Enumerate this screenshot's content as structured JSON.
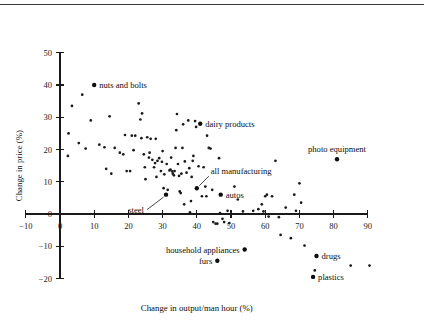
{
  "chart_data": {
    "type": "scatter",
    "title": "",
    "xlabel": "Change in output/man hour (%)",
    "ylabel": "Change in price (%)",
    "xlim": [
      -12,
      95
    ],
    "ylim": [
      -21,
      51
    ],
    "xticks": [
      -10,
      0,
      10,
      20,
      30,
      40,
      50,
      60,
      70,
      80,
      90
    ],
    "yticks": [
      -20,
      -10,
      0,
      10,
      20,
      30,
      40,
      50
    ],
    "xtick_labels": [
      "-10",
      "0",
      "10",
      "20",
      "30",
      "40",
      "50",
      "60",
      "70",
      "80",
      "90"
    ],
    "ytick_labels": [
      "-20",
      "-10",
      "0",
      "10",
      "20",
      "30",
      "40",
      "50"
    ],
    "grid": false,
    "legend": "none",
    "marker": "filled-circle",
    "marker_color": "#1a1a1a",
    "labeled_points": [
      {
        "name": "nuts and bolts",
        "x": 10,
        "y": 40,
        "label_side": "right"
      },
      {
        "name": "dairy products",
        "x": 41,
        "y": 28,
        "label_side": "right"
      },
      {
        "name": "photo equipment",
        "x": 81,
        "y": 17,
        "label_side": "above"
      },
      {
        "name": "all manufacturing",
        "x": 40,
        "y": 8,
        "label_side": "leader-upper-right"
      },
      {
        "name": "steel",
        "x": 31,
        "y": 6,
        "label_side": "leader-lower-left"
      },
      {
        "name": "autos",
        "x": 47,
        "y": 6,
        "label_side": "right"
      },
      {
        "name": "household appliances",
        "x": 54,
        "y": -11,
        "label_side": "left"
      },
      {
        "name": "furs",
        "x": 46,
        "y": -14.5,
        "label_side": "left"
      },
      {
        "name": "drugs",
        "x": 75,
        "y": -13,
        "label_side": "right"
      },
      {
        "name": "plastics",
        "x": 74,
        "y": -19.5,
        "label_side": "right"
      }
    ],
    "points": [
      {
        "x": 2.5,
        "y": 25
      },
      {
        "x": 2.3,
        "y": 18
      },
      {
        "x": 3.5,
        "y": 33.5
      },
      {
        "x": 5.5,
        "y": 22
      },
      {
        "x": 6.5,
        "y": 37
      },
      {
        "x": 7.5,
        "y": 20.3
      },
      {
        "x": 9,
        "y": 29
      },
      {
        "x": 10,
        "y": 40
      },
      {
        "x": 11.5,
        "y": 21.5
      },
      {
        "x": 13,
        "y": 20.7
      },
      {
        "x": 13.5,
        "y": 14
      },
      {
        "x": 14.5,
        "y": 30.3
      },
      {
        "x": 15,
        "y": 12.5
      },
      {
        "x": 16,
        "y": 20.5
      },
      {
        "x": 17.5,
        "y": 19
      },
      {
        "x": 18.5,
        "y": 18.5
      },
      {
        "x": 19,
        "y": 24.5
      },
      {
        "x": 19.5,
        "y": 13.3
      },
      {
        "x": 20.5,
        "y": 13.3
      },
      {
        "x": 21,
        "y": 24.3
      },
      {
        "x": 22,
        "y": 24.3
      },
      {
        "x": 21.5,
        "y": 19.8
      },
      {
        "x": 23,
        "y": 34.3
      },
      {
        "x": 23.5,
        "y": 29.3
      },
      {
        "x": 23.8,
        "y": 23.5
      },
      {
        "x": 24,
        "y": 31.2
      },
      {
        "x": 24.5,
        "y": 18.5
      },
      {
        "x": 24.8,
        "y": 14.5
      },
      {
        "x": 25,
        "y": 10.8
      },
      {
        "x": 25.5,
        "y": 23.8
      },
      {
        "x": 26,
        "y": 17.5
      },
      {
        "x": 26.5,
        "y": 23.3
      },
      {
        "x": 26.2,
        "y": 19
      },
      {
        "x": 27,
        "y": 16.8
      },
      {
        "x": 27.5,
        "y": 14.5
      },
      {
        "x": 27.8,
        "y": 15.8
      },
      {
        "x": 28,
        "y": 23.3
      },
      {
        "x": 28.5,
        "y": 16.5
      },
      {
        "x": 28.2,
        "y": 11.5
      },
      {
        "x": 29,
        "y": 17.3
      },
      {
        "x": 29.5,
        "y": 13.3
      },
      {
        "x": 29.8,
        "y": 16.2
      },
      {
        "x": 30,
        "y": 19.5
      },
      {
        "x": 30.5,
        "y": 12.3
      },
      {
        "x": 30.3,
        "y": 8
      },
      {
        "x": 31,
        "y": 6
      },
      {
        "x": 31.5,
        "y": 7.5
      },
      {
        "x": 31.2,
        "y": 15.5
      },
      {
        "x": 32,
        "y": 13.5
      },
      {
        "x": 32.3,
        "y": 13.8
      },
      {
        "x": 32.5,
        "y": 17.5
      },
      {
        "x": 32.8,
        "y": 13.2
      },
      {
        "x": 33,
        "y": 12.5
      },
      {
        "x": 33.3,
        "y": 12
      },
      {
        "x": 33.5,
        "y": 13.3
      },
      {
        "x": 33.8,
        "y": 20.5
      },
      {
        "x": 34,
        "y": 26
      },
      {
        "x": 34.2,
        "y": 31
      },
      {
        "x": 34.5,
        "y": 15.5
      },
      {
        "x": 34.8,
        "y": 11.8
      },
      {
        "x": 35,
        "y": 7
      },
      {
        "x": 35.3,
        "y": 6.5
      },
      {
        "x": 35.5,
        "y": 12.5
      },
      {
        "x": 35.8,
        "y": 20.5
      },
      {
        "x": 36,
        "y": 27.8
      },
      {
        "x": 36.3,
        "y": 3
      },
      {
        "x": 36.5,
        "y": 16.3
      },
      {
        "x": 37,
        "y": 12.8
      },
      {
        "x": 37.5,
        "y": 29
      },
      {
        "x": 37.8,
        "y": 14.2
      },
      {
        "x": 38,
        "y": 0.5
      },
      {
        "x": 38.3,
        "y": 4
      },
      {
        "x": 38.5,
        "y": 11.5
      },
      {
        "x": 38.8,
        "y": 16.5
      },
      {
        "x": 39,
        "y": 18
      },
      {
        "x": 39.5,
        "y": 28.8
      },
      {
        "x": 39.8,
        "y": 27
      },
      {
        "x": 40,
        "y": 8
      },
      {
        "x": 40.5,
        "y": 14.8
      },
      {
        "x": 41,
        "y": 28
      },
      {
        "x": 41.5,
        "y": 5.5
      },
      {
        "x": 42,
        "y": 14.5
      },
      {
        "x": 42.5,
        "y": 8.5
      },
      {
        "x": 42.8,
        "y": 5.5
      },
      {
        "x": 43,
        "y": 24.3
      },
      {
        "x": 43.5,
        "y": 20.5
      },
      {
        "x": 44,
        "y": 20.3
      },
      {
        "x": 44.5,
        "y": 7.5
      },
      {
        "x": 44.8,
        "y": -2.5
      },
      {
        "x": 45.5,
        "y": -3
      },
      {
        "x": 46,
        "y": -3
      },
      {
        "x": 46.5,
        "y": 17.3
      },
      {
        "x": 46.8,
        "y": 0.3
      },
      {
        "x": 47,
        "y": 6
      },
      {
        "x": 47.5,
        "y": -1.5
      },
      {
        "x": 48,
        "y": -2.5
      },
      {
        "x": 49,
        "y": 1
      },
      {
        "x": 49.5,
        "y": -2.8
      },
      {
        "x": 51,
        "y": 8.5
      },
      {
        "x": 52,
        "y": 4.5
      },
      {
        "x": 53.5,
        "y": 0.8
      },
      {
        "x": 54,
        "y": -11
      },
      {
        "x": 56.5,
        "y": 1
      },
      {
        "x": 58,
        "y": 1.5
      },
      {
        "x": 59,
        "y": 3
      },
      {
        "x": 59.5,
        "y": 0.8
      },
      {
        "x": 60,
        "y": 5.5
      },
      {
        "x": 60.5,
        "y": 6
      },
      {
        "x": 61,
        "y": -0.8
      },
      {
        "x": 62,
        "y": 5.5
      },
      {
        "x": 63,
        "y": 16.5
      },
      {
        "x": 64,
        "y": -1
      },
      {
        "x": 64.5,
        "y": -6.5
      },
      {
        "x": 66,
        "y": 2
      },
      {
        "x": 67.5,
        "y": -7.5
      },
      {
        "x": 68.5,
        "y": 6
      },
      {
        "x": 69,
        "y": 1
      },
      {
        "x": 70,
        "y": 9.5
      },
      {
        "x": 70.5,
        "y": 3.5
      },
      {
        "x": 71.5,
        "y": -9.8
      },
      {
        "x": 74,
        "y": -19.5
      },
      {
        "x": 74.5,
        "y": -17.5
      },
      {
        "x": 75,
        "y": -13
      },
      {
        "x": 81,
        "y": 17
      },
      {
        "x": 85,
        "y": -16
      },
      {
        "x": 90.5,
        "y": -16
      }
    ]
  }
}
